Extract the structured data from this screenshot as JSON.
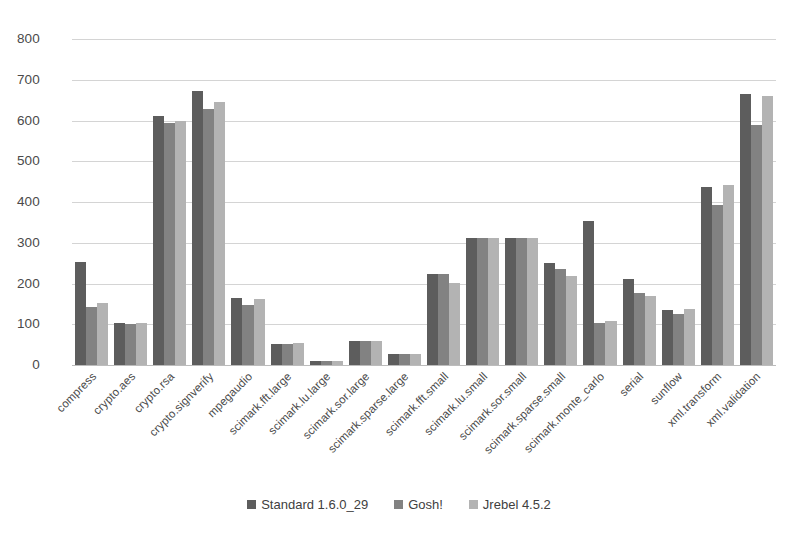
{
  "chart_data": {
    "type": "bar",
    "title": "",
    "subtitle": "",
    "xlabel": "",
    "ylabel": "",
    "ylim": [
      0,
      800
    ],
    "ytick_step": 100,
    "yticks": [
      800,
      700,
      600,
      500,
      400,
      300,
      200,
      100,
      0
    ],
    "grid": true,
    "legend_position": "bottom",
    "categories": [
      "compress",
      "crypto.aes",
      "crypto.rsa",
      "crypto.signverify",
      "mpegaudio",
      "scimark.fft.large",
      "scimark.lu.large",
      "scimark.sor.large",
      "scimark.sparse.large",
      "scimark.fft.small",
      "scimark.lu.small",
      "scimark.sor.small",
      "scimark.sparse.small",
      "scimark.monte_carlo",
      "serial",
      "sunflow",
      "xml.transform",
      "xml.validation"
    ],
    "series": [
      {
        "name": "Standard 1.6.0_29",
        "color": "#5d5d5d",
        "values": [
          253,
          103,
          612,
          673,
          165,
          52,
          10,
          58,
          27,
          223,
          311,
          311,
          250,
          354,
          212,
          135,
          438,
          665
        ]
      },
      {
        "name": "Gosh!",
        "color": "#828282",
        "values": [
          142,
          101,
          595,
          628,
          147,
          52,
          10,
          58,
          27,
          223,
          311,
          311,
          236,
          104,
          177,
          124,
          393,
          590
        ]
      },
      {
        "name": "Jrebel 4.5.2",
        "color": "#b3b3b3",
        "values": [
          152,
          102,
          600,
          645,
          163,
          53,
          10,
          58,
          27,
          202,
          311,
          311,
          219,
          108,
          170,
          138,
          441,
          660
        ]
      }
    ]
  },
  "colors": {
    "background": "#ffffff",
    "gridline": "#d4d4d4",
    "axis_text": "#4a4a4a",
    "series_1": "#5d5d5d",
    "series_2": "#828282",
    "series_3": "#b3b3b3"
  }
}
